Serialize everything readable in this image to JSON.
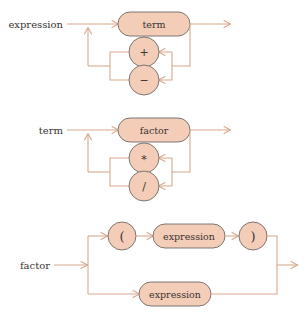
{
  "page": {
    "background_color": "#ffffff",
    "wire_color": "#d8a98e",
    "node_fill_color": "#f4cdb9",
    "node_stroke_color": "#6f6a66",
    "text_color": "#3a3330"
  },
  "diagrams": [
    {
      "id": "expression",
      "label": "expression",
      "nodes": {
        "main": "term",
        "op_upper": "+",
        "op_lower": "−"
      }
    },
    {
      "id": "term",
      "label": "term",
      "nodes": {
        "main": "factor",
        "op_upper": "*",
        "op_lower": "/"
      }
    },
    {
      "id": "factor",
      "label": "factor",
      "nodes": {
        "lparen": "(",
        "inner": "expression",
        "rparen": ")",
        "alt": "expression"
      }
    }
  ]
}
